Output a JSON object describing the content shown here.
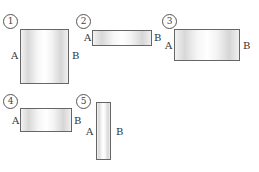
{
  "diagram": {
    "colors": {
      "border": "#666666",
      "shade_dark": "#d6d6d6",
      "shade_light": "#ffffff"
    },
    "items": [
      {
        "number": "1",
        "left_label": "A",
        "right_label": "B"
      },
      {
        "number": "2",
        "left_label": "A",
        "right_label": "B"
      },
      {
        "number": "3",
        "left_label": "A",
        "right_label": "B"
      },
      {
        "number": "4",
        "left_label": "A",
        "right_label": "B"
      },
      {
        "number": "5",
        "left_label": "A",
        "right_label": "B"
      }
    ]
  }
}
